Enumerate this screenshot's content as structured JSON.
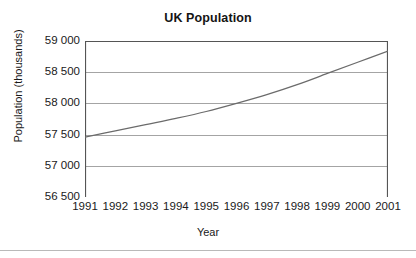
{
  "chart_data": {
    "type": "line",
    "title": "UK Population",
    "xlabel": "Year",
    "ylabel": "Population (thousands)",
    "x": [
      1991,
      1992,
      1993,
      1994,
      1995,
      1996,
      1997,
      1998,
      1999,
      2000,
      2001
    ],
    "values": [
      57460,
      57560,
      57660,
      57760,
      57870,
      58000,
      58140,
      58300,
      58480,
      58660,
      58840
    ],
    "series": [
      {
        "name": "UK Population",
        "values": [
          57460,
          57560,
          57660,
          57760,
          57870,
          58000,
          58140,
          58300,
          58480,
          58660,
          58840
        ]
      }
    ],
    "categories": [
      "1991",
      "1992",
      "1993",
      "1994",
      "1995",
      "1996",
      "1997",
      "1998",
      "1999",
      "2000",
      "2001"
    ],
    "xlim": [
      1991,
      2001
    ],
    "ylim": [
      56500,
      59000
    ],
    "yticks": [
      56500,
      57000,
      57500,
      58000,
      58500,
      59000
    ],
    "ytick_labels": [
      "56 500",
      "57 000",
      "57 500",
      "58 000",
      "58 500",
      "59 000"
    ],
    "xticks": [
      1991,
      1992,
      1993,
      1994,
      1995,
      1996,
      1997,
      1998,
      1999,
      2000,
      2001
    ],
    "xtick_labels": [
      "1991",
      "1992",
      "1993",
      "1994",
      "1995",
      "1996",
      "1997",
      "1998",
      "1999",
      "2000",
      "2001"
    ],
    "grid": "horizontal",
    "legend": "none",
    "line_color": "#6b6b6b",
    "grid_color": "#9a9a9a",
    "axis_color": "#555555",
    "background": "#ffffff"
  }
}
